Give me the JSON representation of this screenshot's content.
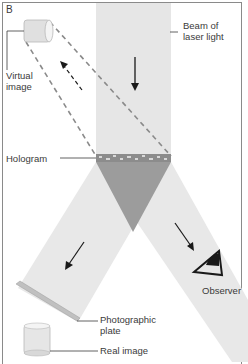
{
  "figure": {
    "panel_letter": "B",
    "colors": {
      "frame": "#8a8a8a",
      "beam": "#e4e4e4",
      "beam_overlap": "#9a9a9a",
      "hologram_strip": "#8c8c8c",
      "dashed_line": "#8a8a8a",
      "arrow": "#1a1a1a",
      "text": "#3a3a3a"
    }
  },
  "labels": {
    "beam": "Beam of\nlaser light",
    "virtual_image": "Virtual\nimage",
    "hologram": "Hologram",
    "observer": "Observer",
    "photographic_plate": "Photographic\nplate",
    "real_image": "Real image"
  },
  "icons": {
    "virtual_image": "cylinder-object",
    "real_image": "cylinder-object",
    "observer": "eye-icon"
  }
}
